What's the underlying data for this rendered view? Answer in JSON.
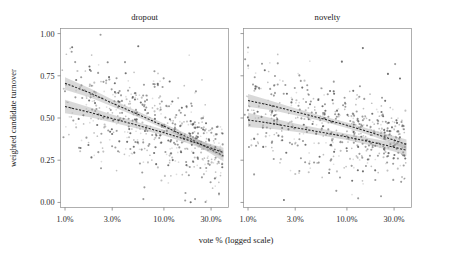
{
  "figure": {
    "width": 460,
    "height": 255,
    "background": "#ffffff",
    "axis_color": "#8d8d8d",
    "point_color": "#4a4a4a",
    "band_color": "#9a9a9a",
    "line_color": "#222222"
  },
  "labels": {
    "y_axis_title": "weighted candidate turnover",
    "x_axis_title": "vote % (logged scale)"
  },
  "chart_data": {
    "type": "scatter",
    "title": "",
    "xlabel": "vote % (logged scale)",
    "ylabel": "weighted candidate turnover",
    "x_scale": "log",
    "xlim": [
      0.9,
      45.0
    ],
    "ylim": [
      -0.03,
      1.03
    ],
    "grid": false,
    "legend": "none",
    "x_ticks": [
      {
        "value": 1.0,
        "label": "1.0%"
      },
      {
        "value": 3.0,
        "label": "3.0%"
      },
      {
        "value": 10.0,
        "label": "10.0%"
      },
      {
        "value": 30.0,
        "label": "30.0%"
      }
    ],
    "y_ticks": [
      {
        "value": 0.0,
        "label": "0.00"
      },
      {
        "value": 0.25,
        "label": "0.25"
      },
      {
        "value": 0.5,
        "label": "0.50"
      },
      {
        "value": 0.75,
        "label": "0.75"
      },
      {
        "value": 1.0,
        "label": "1.00"
      }
    ],
    "facets": [
      {
        "name": "dropout",
        "label": "dropout",
        "fits": [
          {
            "name": "upper-fit",
            "x": [
              1.0,
              1.8,
              3.0,
              5.5,
              10.0,
              18.0,
              30.0,
              40.0
            ],
            "y": [
              0.706,
              0.648,
              0.588,
              0.521,
              0.452,
              0.381,
              0.313,
              0.275
            ],
            "ci_lower": [
              0.668,
              0.622,
              0.568,
              0.505,
              0.437,
              0.363,
              0.289,
              0.243
            ],
            "ci_upper": [
              0.742,
              0.674,
              0.609,
              0.538,
              0.468,
              0.399,
              0.337,
              0.307
            ]
          },
          {
            "name": "lower-fit",
            "x": [
              1.0,
              1.8,
              3.0,
              5.5,
              10.0,
              18.0,
              30.0,
              40.0
            ],
            "y": [
              0.568,
              0.533,
              0.497,
              0.456,
              0.413,
              0.367,
              0.322,
              0.295
            ],
            "ci_lower": [
              0.528,
              0.504,
              0.473,
              0.437,
              0.396,
              0.348,
              0.298,
              0.266
            ],
            "ci_upper": [
              0.608,
              0.562,
              0.521,
              0.475,
              0.43,
              0.386,
              0.346,
              0.324
            ]
          }
        ],
        "n_points": 560,
        "point_cloud_note": "dense scatter 0.00-1.00, heaviest mass 0.2-0.6, thinning to the right"
      },
      {
        "name": "novelty",
        "label": "novelty",
        "fits": [
          {
            "name": "upper-fit",
            "x": [
              1.0,
              1.8,
              3.0,
              5.5,
              10.0,
              18.0,
              30.0,
              40.0
            ],
            "y": [
              0.604,
              0.571,
              0.537,
              0.498,
              0.457,
              0.412,
              0.369,
              0.343
            ],
            "ci_lower": [
              0.566,
              0.545,
              0.517,
              0.482,
              0.441,
              0.394,
              0.345,
              0.313
            ],
            "ci_upper": [
              0.642,
              0.597,
              0.557,
              0.514,
              0.473,
              0.43,
              0.393,
              0.373
            ]
          },
          {
            "name": "lower-fit",
            "x": [
              1.0,
              1.8,
              3.0,
              5.5,
              10.0,
              18.0,
              30.0,
              40.0
            ],
            "y": [
              0.489,
              0.466,
              0.443,
              0.416,
              0.388,
              0.357,
              0.327,
              0.309
            ],
            "ci_lower": [
              0.447,
              0.435,
              0.418,
              0.396,
              0.369,
              0.336,
              0.301,
              0.276
            ],
            "ci_upper": [
              0.531,
              0.497,
              0.468,
              0.436,
              0.407,
              0.378,
              0.353,
              0.342
            ]
          }
        ],
        "n_points": 560,
        "point_cloud_note": "dense scatter 0.00-1.00, heaviest mass 0.2-0.6, thinning to the right"
      }
    ]
  }
}
